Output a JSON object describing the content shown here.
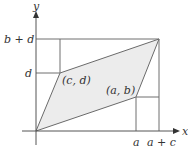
{
  "diagram": {
    "type": "parallelogram-on-axes",
    "axes": {
      "x_label": "x",
      "y_label": "y"
    },
    "points": {
      "origin": {
        "label": ""
      },
      "ab": {
        "label": "(a, b)"
      },
      "cd": {
        "label": "(c, d)"
      },
      "sum": {
        "label": ""
      }
    },
    "x_ticks": [
      "a",
      "a + c"
    ],
    "y_ticks": [
      "d",
      "b + d"
    ],
    "colors": {
      "fill": "#ececec",
      "line": "#666666",
      "axis": "#555555",
      "text": "#333333"
    }
  }
}
